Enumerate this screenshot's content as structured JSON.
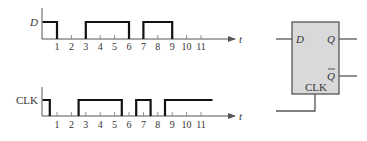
{
  "figure": {
    "type": "timing-diagram-with-d-flip-flop",
    "time_axis_label": "t",
    "tick_labels": [
      "1",
      "2",
      "3",
      "4",
      "5",
      "6",
      "7",
      "8",
      "9",
      "10",
      "11"
    ]
  },
  "waveforms": {
    "D": {
      "label": "D",
      "high_intervals": [
        [
          0,
          1
        ],
        [
          3,
          6
        ],
        [
          7,
          9
        ]
      ]
    },
    "CLK": {
      "label": "CLK",
      "high_intervals": [
        [
          0,
          0.5
        ],
        [
          2.5,
          5.5
        ],
        [
          6.5,
          7.5
        ],
        [
          8.5,
          11.8
        ]
      ]
    }
  },
  "flip_flop": {
    "inputs": {
      "d": "D",
      "clk": "CLK"
    },
    "outputs": {
      "q": "Q",
      "q_bar": "Q"
    },
    "fill_color": "#d9d9d9",
    "stroke_color": "#555555"
  },
  "colors": {
    "waveform": "#111111",
    "axis": "#555555"
  }
}
